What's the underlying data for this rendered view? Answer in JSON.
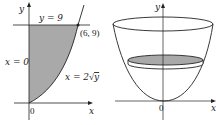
{
  "left_figure": {
    "axis_labels": {
      "x": "x",
      "y": "y",
      "origin": "0"
    },
    "line_label": "y = 9",
    "yaxis_label": "x = 0",
    "curve_label_prefix": "x = 2",
    "curve_label_sqrt": "√",
    "curve_label_var": "y",
    "point_label": "(6, 9)",
    "region_fill": "#a9a9a9"
  },
  "right_figure": {
    "axis_labels": {
      "x": "x",
      "y": "y",
      "origin": "0"
    },
    "disk_fill": "#a9a9a9"
  },
  "colors": {
    "stroke": "#222222",
    "fill": "#a9a9a9",
    "background": "#ffffff"
  }
}
